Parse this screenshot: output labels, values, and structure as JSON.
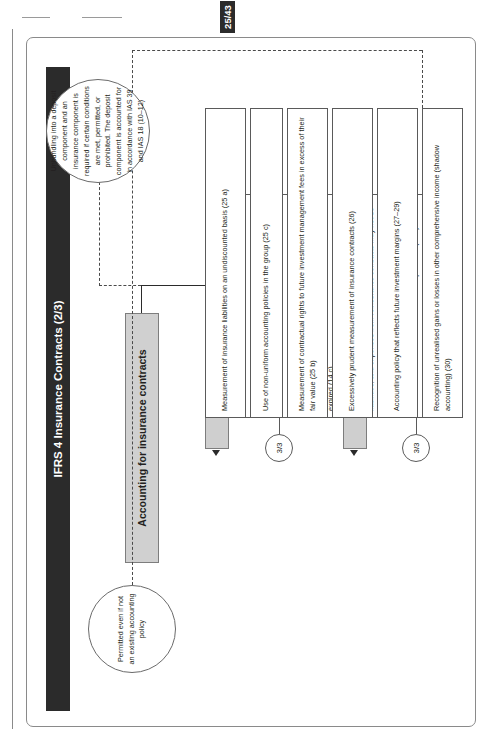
{
  "page": {
    "number_badge": "25/43",
    "title": "IFRS 4 Insurance Contracts (2/3)"
  },
  "root": {
    "label": "Accounting for insurance contracts"
  },
  "notes": {
    "unbundling": "Unbundling into a deposit component and an insurance component is required if certain conditions are met, permitted, or prohibited. The deposit component is accounted for in accordance with IAS 39 and IAS 18 (10–12)",
    "permitted": "Permitted even if not an existing accounting policy"
  },
  "columns": [
    {
      "key": "fundamental_principles",
      "header": "Fundamental principles",
      "badge": "3/3",
      "items": [
        "No provisions may be recognised for possible future claims arising under future insurance contracts (e.g. catastrophe and equalisation provisions) (14 a)",
        "Application of a liability adequacy test (14 b)",
        "An insurance liability is removed from the statement of financial position when it is extinguished, i.e. discharged, cancelled, or expired (14 c)",
        "Reinsurance assets may not be offset against insurance liabilities, and expenses from reinsurance contracts may not be offset against income from the related insurance contract (14 d)",
        "Reinsurance assets must be tested for impairment (14 e)"
      ]
    },
    {
      "key": "continuation_of_existing_accounting_practices",
      "header": "Continuation of existing accounting practices",
      "badge": "3/3",
      "items": [
        "Measurement of insurance liabilities on an undiscounted basis (25 a)",
        "Use of non-uniform accounting policies in the group (25 c)",
        "Measurement of contractual rights to future investment management fees in excess of their fair value (25 b)",
        "Excessively prudent measurement of insurance contracts (26)",
        "Accounting policy that reflects future investment margins (27–29)",
        "Recognition of unrealised gains or losses in other comprehensive income (shadow accounting) (30)"
      ]
    }
  ],
  "colors": {
    "title_bar": "#2b2b2b",
    "header_fill": "#cfcfcf",
    "root_fill": "#d0d0d0",
    "line": "#2b2b2b"
  }
}
